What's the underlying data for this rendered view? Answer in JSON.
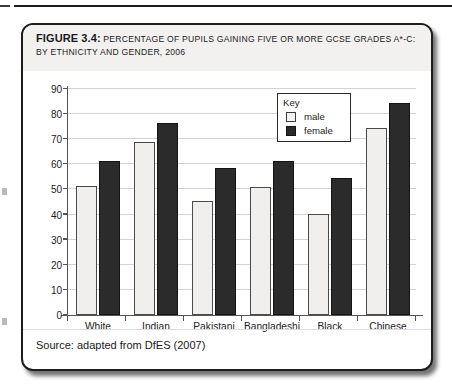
{
  "figure": {
    "label": "FIGURE 3.4:",
    "caption": "Percentage of pupils gaining five or more GCSE grades A*-C: by ethnicity and gender, 2006",
    "source": "Source: adapted from DfES (2007)"
  },
  "legend": {
    "title": "Key",
    "entries": [
      {
        "label": "male",
        "color": "#f0efed"
      },
      {
        "label": "female",
        "color": "#2b2b2b"
      }
    ]
  },
  "colors": {
    "male_fill": "#f0efed",
    "female_fill": "#2b2b2b",
    "axis": "#555555",
    "grid": "#d3d3d3",
    "caption_band": "#f2f1f0",
    "box_border": "#1d1d1d"
  },
  "chart_data": {
    "type": "bar",
    "title": "Percentage of pupils gaining five or more GCSE grades A*-C: by ethnicity and gender, 2006",
    "xlabel": "",
    "ylabel": "",
    "categories": [
      "White",
      "Indian",
      "Pakistani",
      "Bangladeshi",
      "Black",
      "Chinese"
    ],
    "series": [
      {
        "name": "male",
        "values": [
          51.4,
          68.9,
          45.3,
          50.8,
          40.4,
          74.5
        ]
      },
      {
        "name": "female",
        "values": [
          61.2,
          76.3,
          58.4,
          61.3,
          54.7,
          84.5
        ]
      }
    ],
    "ylim": [
      0,
      90
    ],
    "yticks": [
      0,
      10,
      20,
      30,
      40,
      50,
      60,
      70,
      80,
      90
    ],
    "ytick_labels": [
      "0",
      "10",
      "20",
      "30",
      "40",
      "50",
      "60",
      "70",
      "80",
      "90"
    ],
    "grid": true,
    "legend_position": "top-right",
    "source": "adapted from DfES (2007)"
  }
}
